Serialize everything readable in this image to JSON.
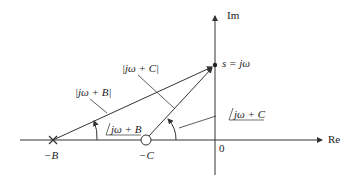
{
  "diagram": {
    "axes": {
      "real_label": "Re",
      "imag_label": "Im",
      "origin_label": "0"
    },
    "points": {
      "pole_label": "−B",
      "zero_label": "−C",
      "test_point_label": "s = jω"
    },
    "vectors": {
      "mag_B": "|jω + B|",
      "mag_C": "|jω + C|",
      "angle_B": "jω + B",
      "angle_C": "jω + C"
    },
    "colors": {
      "line": "#333333"
    }
  }
}
